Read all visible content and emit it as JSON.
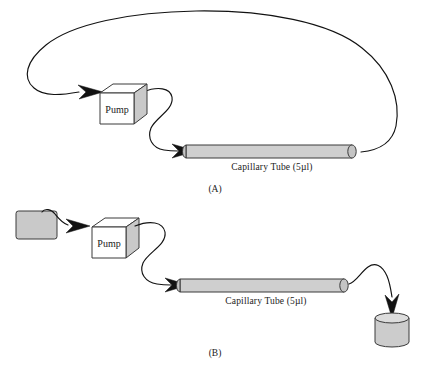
{
  "figure": {
    "caption_a": "(A)",
    "caption_b": "(B)"
  },
  "panel_a": {
    "id": "(A)",
    "pump_label": "Pump",
    "tube_label": "Capillary Tube (5µl)",
    "components": [
      {
        "name": "pump",
        "label": "Pump",
        "type": "box-3d"
      },
      {
        "name": "capillary-tube",
        "label": "Capillary Tube (5µl)",
        "type": "cylinder"
      },
      {
        "name": "recirculation-loop",
        "label": "",
        "type": "flow-line"
      }
    ]
  },
  "panel_b": {
    "id": "(B)",
    "pump_label": "Pump",
    "tube_label": "Capillary Tube (5µl)",
    "components": [
      {
        "name": "source-reservoir",
        "label": "",
        "type": "rect-vessel"
      },
      {
        "name": "pump",
        "label": "Pump",
        "type": "box-3d"
      },
      {
        "name": "capillary-tube",
        "label": "Capillary Tube (5µl)",
        "type": "cylinder"
      },
      {
        "name": "collection-vessel",
        "label": "",
        "type": "cylinder-vessel"
      }
    ]
  },
  "colors": {
    "stroke": "#121212",
    "outline": "#3a3a3a",
    "tube_fill": "#cfcfcf",
    "vessel_fill": "#cccccc",
    "box_face": "#ffffff",
    "box_shade": "#c9c9c9",
    "background": "#ffffff"
  }
}
